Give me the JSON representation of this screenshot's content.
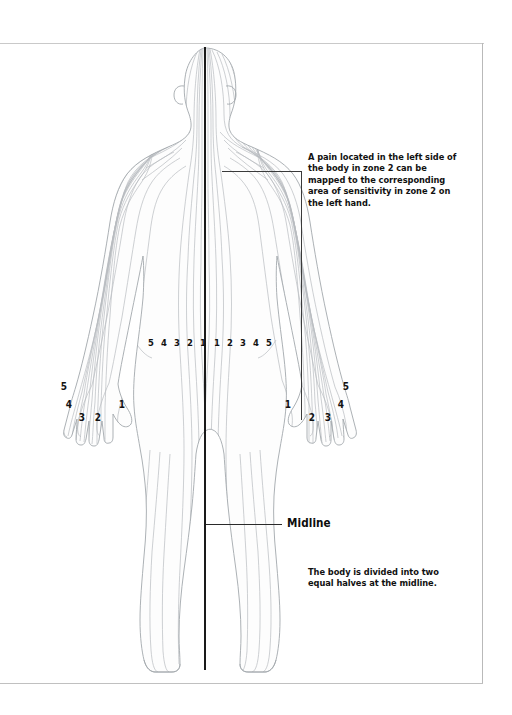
{
  "diagram": {
    "figure_name": "human-body-back-view",
    "colors": {
      "midline": "#1a1a1a",
      "zone_line": "#b5b8bd",
      "body_outline": "#9aa0a6",
      "text": "#111111",
      "frame": "#c0c0c0"
    }
  },
  "annotations": {
    "zone_note": "A pain located in the left side of the body in zone 2 can be mapped to the corresponding area of sensitivity in zone 2 on the left hand.",
    "midline_label": "Midline",
    "midline_note": "The body is divided into two equal halves at the midline."
  },
  "zone_labels": {
    "left_side": [
      "5",
      "4",
      "3",
      "2",
      "1"
    ],
    "right_side": [
      "1",
      "2",
      "3",
      "4",
      "5"
    ]
  },
  "hand_labels": {
    "left_hand": [
      "5",
      "4",
      "3",
      "2",
      "1"
    ],
    "right_hand": [
      "1",
      "2",
      "3",
      "4",
      "5"
    ]
  },
  "waist_zone_positions": {
    "left_x": [
      146,
      159,
      172,
      185,
      198
    ],
    "right_x": [
      212,
      225,
      238,
      251,
      264
    ],
    "y": 337
  },
  "left_hand_positions": [
    {
      "label": "5",
      "x": 59,
      "y": 381
    },
    {
      "label": "4",
      "x": 64,
      "y": 399
    },
    {
      "label": "3",
      "x": 77,
      "y": 412
    },
    {
      "label": "2",
      "x": 93,
      "y": 412
    },
    {
      "label": "1",
      "x": 117,
      "y": 399
    }
  ],
  "right_hand_positions": [
    {
      "label": "1",
      "x": 283,
      "y": 399
    },
    {
      "label": "2",
      "x": 307,
      "y": 412
    },
    {
      "label": "3",
      "x": 323,
      "y": 412
    },
    {
      "label": "4",
      "x": 336,
      "y": 399
    },
    {
      "label": "5",
      "x": 341,
      "y": 381
    }
  ]
}
